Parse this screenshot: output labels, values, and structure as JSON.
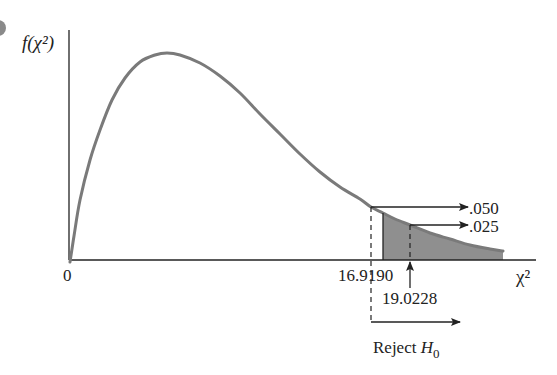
{
  "chart_data": {
    "type": "area",
    "title": "",
    "xlabel": "χ²",
    "ylabel": "f(χ²)",
    "origin_label": "0",
    "curve": {
      "description": "Chi-square probability density curve (right-skewed)",
      "color": "#7a7a7a",
      "points_px": [
        [
          70,
          262
        ],
        [
          74,
          236
        ],
        [
          80,
          200
        ],
        [
          90,
          160
        ],
        [
          100,
          130
        ],
        [
          112,
          100
        ],
        [
          125,
          78
        ],
        [
          140,
          62
        ],
        [
          155,
          55
        ],
        [
          167,
          53
        ],
        [
          180,
          55
        ],
        [
          200,
          63
        ],
        [
          220,
          76
        ],
        [
          240,
          93
        ],
        [
          260,
          114
        ],
        [
          280,
          134
        ],
        [
          300,
          154
        ],
        [
          320,
          172
        ],
        [
          340,
          187
        ],
        [
          360,
          199
        ],
        [
          371,
          207
        ],
        [
          383,
          213
        ],
        [
          395,
          219
        ],
        [
          410,
          225
        ],
        [
          430,
          233
        ],
        [
          450,
          239
        ],
        [
          470,
          245
        ],
        [
          490,
          249
        ],
        [
          503,
          251
        ]
      ]
    },
    "critical_values": [
      {
        "value": 16.919,
        "label": "16.9190",
        "alpha": 0.05,
        "alpha_label": ".050",
        "line_style": "dashed"
      },
      {
        "value": 19.0228,
        "label": "19.0228",
        "alpha": 0.025,
        "alpha_label": ".025",
        "line_style": "dashed"
      }
    ],
    "shaded_region": {
      "description": "Upper tail area beyond critical value",
      "color": "#8f8f8f"
    },
    "annotation": {
      "text": "Reject ",
      "subject": "H",
      "subscript": "0"
    },
    "axes": {
      "grid": false,
      "x_ticks": [
        "0",
        "16.9190",
        "19.0228"
      ]
    }
  }
}
